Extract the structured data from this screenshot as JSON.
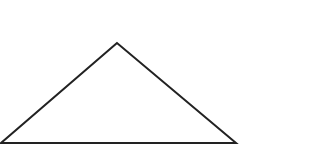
{
  "canvas": {
    "width": 318,
    "height": 168,
    "background": "#ffffff"
  },
  "diagram": {
    "shape": "triangle",
    "fill": "none",
    "stroke": "#222222",
    "stroke_width": 2,
    "vertices": {
      "apex": {
        "x": 117,
        "y": 43
      },
      "bottom_left": {
        "x": 1,
        "y": 143
      },
      "bottom_right": {
        "x": 236,
        "y": 143
      }
    },
    "points": "117,43 1,143 236,143"
  }
}
